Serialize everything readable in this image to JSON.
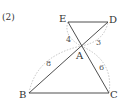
{
  "problem_label": "(2)",
  "points": {
    "E": {
      "label": "E",
      "x": 68,
      "y": 22
    },
    "D": {
      "label": "D",
      "x": 108,
      "y": 22
    },
    "A": {
      "label": "A",
      "x": 81,
      "y": 46
    },
    "B": {
      "label": "B",
      "x": 29,
      "y": 93
    },
    "C": {
      "label": "C",
      "x": 109,
      "y": 93
    }
  },
  "segments": [
    {
      "from": "E",
      "to": "D"
    },
    {
      "from": "E",
      "to": "C"
    },
    {
      "from": "D",
      "to": "B"
    },
    {
      "from": "B",
      "to": "C"
    }
  ],
  "lengths": {
    "EA": "4",
    "AD": "3",
    "BA": "8",
    "AC": "6"
  },
  "colors": {
    "line": "#3a3a3a",
    "arc": "#aaaaaa",
    "text": "#333333"
  }
}
